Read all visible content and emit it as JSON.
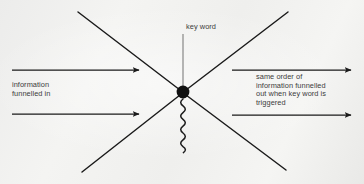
{
  "figure": {
    "type": "concept-diagram",
    "background_color": "#f2f2f0",
    "ink_color": "#1a1a1a",
    "text_color": "#3b3b3b",
    "labels": {
      "key_word": "key word",
      "left_input": "information\nfunnelled in",
      "right_output": "same order of\ninformation funnelled\nout when key word is\ntriggered"
    },
    "elements": {
      "node": {
        "name": "key-word-node",
        "shape": "filled-circle",
        "cx": 183,
        "cy": 92,
        "r": 6.5
      },
      "stem": {
        "name": "key-word-stem",
        "x": 183,
        "y1": 34,
        "y2": 92
      },
      "squiggle": {
        "name": "trigger-squiggle",
        "x": 183,
        "y1": 98,
        "y2": 146,
        "waves": 9
      },
      "funnel_lines": [
        {
          "name": "funnel-line-upper-left",
          "x1": 78,
          "y1": 12,
          "x2": 183,
          "y2": 92
        },
        {
          "name": "funnel-line-upper-right",
          "x1": 288,
          "y1": 12,
          "x2": 183,
          "y2": 92
        },
        {
          "name": "funnel-line-lower-left",
          "x1": 82,
          "y1": 172,
          "x2": 183,
          "y2": 92
        },
        {
          "name": "funnel-line-lower-right",
          "x1": 286,
          "y1": 170,
          "x2": 183,
          "y2": 92
        }
      ],
      "arrows": [
        {
          "name": "input-arrow-top",
          "x1": 12,
          "y": 70,
          "x2": 141,
          "direction": "right"
        },
        {
          "name": "input-arrow-bottom",
          "x1": 12,
          "y": 114,
          "x2": 141,
          "direction": "right"
        },
        {
          "name": "output-arrow-top",
          "x1": 232,
          "y": 70,
          "x2": 353,
          "direction": "right"
        },
        {
          "name": "output-arrow-bottom",
          "x1": 232,
          "y": 115,
          "x2": 353,
          "direction": "right"
        }
      ]
    }
  }
}
